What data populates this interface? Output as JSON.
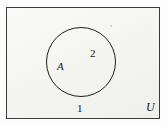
{
  "figure": {
    "type": "venn-diagram",
    "background_color": "#fdfdfd",
    "interior_color": "#f6f6f4",
    "stroke_color": "#1d1d1d"
  },
  "universe": {
    "label": "U",
    "border_color": "#3a3a3a"
  },
  "set_a": {
    "label": "A",
    "shape": "circle",
    "border_color": "#1d1d1d"
  },
  "regions": [
    {
      "id": "region-1",
      "label": "1",
      "location": "outside-circle-inside-universe"
    },
    {
      "id": "region-2",
      "label": "2",
      "location": "inside-circle"
    }
  ]
}
